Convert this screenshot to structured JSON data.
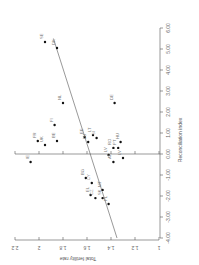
{
  "chart_data": {
    "type": "scatter",
    "rotation_deg": 90,
    "xlabel": "Reconciliation index",
    "ylabel": "Total fertility rate",
    "xlim": [
      -4.0,
      6.0
    ],
    "ylim": [
      1.0,
      2.2
    ],
    "x_ticks": [
      "-4.00",
      "-3.00",
      "-2.00",
      "-1.00",
      "0.00",
      "1.00",
      "2.00",
      "3.00",
      "4.00",
      "5.00",
      "6.00"
    ],
    "y_ticks": [
      "1",
      "1.2",
      "1.4",
      "1.6",
      "1.8",
      "2",
      "2.2"
    ],
    "grid": false,
    "legend": null,
    "points": [
      {
        "label": "SE",
        "x": 5.33,
        "y": 1.95
      },
      {
        "label": "DK",
        "x": 5.05,
        "y": 1.85
      },
      {
        "label": "NL",
        "x": 2.43,
        "y": 1.8
      },
      {
        "label": "FI",
        "x": 1.38,
        "y": 1.87
      },
      {
        "label": "FR",
        "x": 0.62,
        "y": 2.01
      },
      {
        "label": "UK",
        "x": 0.43,
        "y": 1.95
      },
      {
        "label": "BE",
        "x": 0.62,
        "y": 1.85
      },
      {
        "label": "IE",
        "x": -0.38,
        "y": 2.07
      },
      {
        "label": "EE",
        "x": 0.81,
        "y": 1.62
      },
      {
        "label": "LU",
        "x": 0.57,
        "y": 1.59
      },
      {
        "label": "LT",
        "x": 0.9,
        "y": 1.55
      },
      {
        "label": "SI",
        "x": 0.76,
        "y": 1.52
      },
      {
        "label": "DE",
        "x": 2.43,
        "y": 1.37
      },
      {
        "label": "HU",
        "x": 0.57,
        "y": 1.32
      },
      {
        "label": "RO",
        "x": 0.29,
        "y": 1.38
      },
      {
        "label": "PT",
        "x": 0.29,
        "y": 1.34
      },
      {
        "label": "LV",
        "x": -0.05,
        "y": 1.42
      },
      {
        "label": "AT",
        "x": -0.38,
        "y": 1.38
      },
      {
        "label": "LV",
        "x": -0.19,
        "y": 1.3
      },
      {
        "label": "BG",
        "x": -1.14,
        "y": 1.61
      },
      {
        "label": "CY",
        "x": -1.38,
        "y": 1.56
      },
      {
        "label": "EL",
        "x": -1.95,
        "y": 1.57
      },
      {
        "label": "CZ",
        "x": -2.1,
        "y": 1.53
      },
      {
        "label": "MT",
        "x": -1.71,
        "y": 1.47
      },
      {
        "label": "SK",
        "x": -2.1,
        "y": 1.47
      },
      {
        "label": "PL",
        "x": -2.38,
        "y": 1.42
      }
    ],
    "regression_line": {
      "x": [
        -4.0,
        5.5
      ],
      "y": [
        1.35,
        1.88
      ]
    }
  },
  "labels": {
    "x_axis_title": "Reconciliation index",
    "y_axis_title": "Total fertility rate"
  }
}
